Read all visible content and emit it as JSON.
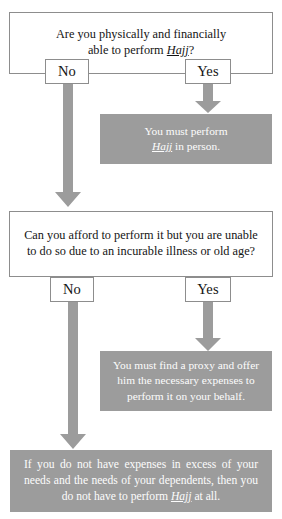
{
  "diagram": {
    "colors": {
      "box_fill": "#ffffff",
      "box_border": "#8d8d8d",
      "result_fill": "#9c9c9c",
      "result_text": "#fdfdfd",
      "arrow_fill": "#9c9c9c",
      "text": "#141414"
    }
  },
  "questions": [
    {
      "id": "q1",
      "line1": "Are you physically and financially",
      "line2_pre": "able to perform ",
      "line2_term": "Hajj",
      "line2_post": "?"
    },
    {
      "id": "q2",
      "line1": "Can you afford to perform it but you are unable",
      "line2": "to do so due to an incurable illness or old age?"
    }
  ],
  "decisions": [
    {
      "id": "q1-no",
      "label": "No"
    },
    {
      "id": "q1-yes",
      "label": "Yes"
    },
    {
      "id": "q2-no",
      "label": "No"
    },
    {
      "id": "q2-yes",
      "label": "Yes"
    }
  ],
  "results": [
    {
      "id": "r1",
      "line1": "You must perform",
      "line2_pre": "",
      "line2_term": "Hajj",
      "line2_post": " in person."
    },
    {
      "id": "r2",
      "line1": "You must find a proxy and offer",
      "line2": "him the necessary expenses to",
      "line3": "perform it on your behalf."
    },
    {
      "id": "r3",
      "line1": "If you do not have expenses in excess of your",
      "line2": "needs and the needs of your dependents, then you",
      "line3_pre": "do not have to perform ",
      "line3_term": "Hajj",
      "line3_post": " at all."
    }
  ]
}
